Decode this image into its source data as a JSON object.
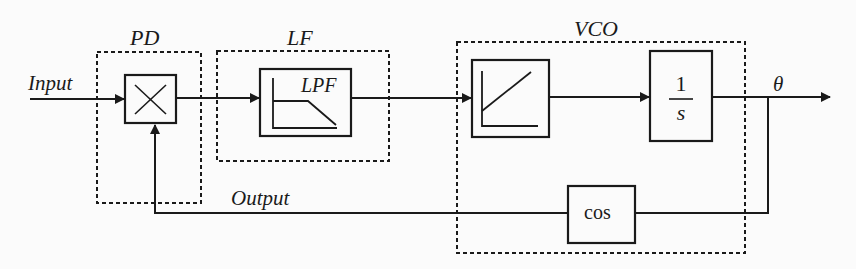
{
  "diagram": {
    "type": "block-diagram",
    "groups": [
      {
        "id": "pd",
        "label": "PD",
        "blocks": [
          "multiplier"
        ]
      },
      {
        "id": "lf",
        "label": "LF",
        "blocks": [
          "lpf"
        ]
      },
      {
        "id": "vco",
        "label": "VCO",
        "blocks": [
          "ramp",
          "integrator",
          "cos"
        ]
      }
    ],
    "blocks": {
      "multiplier": {
        "symbol": "×",
        "icon": "multiplier-icon"
      },
      "lpf": {
        "label": "LPF",
        "icon": "lowpass-response-icon"
      },
      "ramp": {
        "icon": "linear-ramp-icon"
      },
      "integrator": {
        "numerator": "1",
        "denominator": "s"
      },
      "cos": {
        "label": "cos"
      }
    },
    "signals": {
      "input": "Input",
      "output": "Output",
      "theta": "θ"
    },
    "edges": [
      {
        "from": "input",
        "to": "multiplier"
      },
      {
        "from": "multiplier",
        "to": "lpf"
      },
      {
        "from": "lpf",
        "to": "ramp"
      },
      {
        "from": "ramp",
        "to": "integrator"
      },
      {
        "from": "integrator",
        "to": "theta"
      },
      {
        "from": "theta",
        "to": "cos"
      },
      {
        "from": "cos",
        "to": "multiplier",
        "label": "Output"
      }
    ],
    "colors": {
      "line": "#1a1a1a",
      "background": "#fbfbfb"
    }
  }
}
